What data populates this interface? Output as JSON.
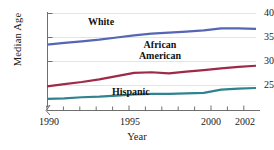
{
  "chart_data": {
    "type": "line",
    "title": "",
    "xlabel": "Year",
    "ylabel": "Median Age",
    "xlim": [
      1990,
      2002
    ],
    "ylim": [
      23.5,
      41
    ],
    "grid": true,
    "legend_position": "inline-annotations",
    "x": [
      1990,
      1991,
      1992,
      1993,
      1994,
      1995,
      1996,
      1997,
      1998,
      1999,
      2000,
      2001,
      2002
    ],
    "xticks": [
      1990,
      1991,
      1992,
      1993,
      1994,
      1995,
      1996,
      1997,
      1998,
      1999,
      2000,
      2001,
      2002
    ],
    "xticklabels": [
      "1990",
      "",
      "",
      "",
      "",
      "1995",
      "",
      "",
      "",
      "",
      "2000",
      "",
      "2002"
    ],
    "yticks": [
      25,
      30,
      35,
      40
    ],
    "yticklabels": [
      "25",
      "30",
      "35",
      "40"
    ],
    "series": [
      {
        "name": "White",
        "color": "#5566b4",
        "values": [
          35.0,
          35.3,
          35.6,
          35.9,
          36.3,
          36.7,
          37.0,
          37.2,
          37.4,
          37.6,
          38.0,
          38.0,
          37.9
        ]
      },
      {
        "name": "African American",
        "color": "#9e2a48",
        "values": [
          27.3,
          27.7,
          28.1,
          28.6,
          29.2,
          29.8,
          29.9,
          29.7,
          30.0,
          30.3,
          30.6,
          30.9,
          31.1
        ]
      },
      {
        "name": "Hispanic",
        "color": "#2f8290",
        "values": [
          25.0,
          25.1,
          25.3,
          25.4,
          25.6,
          25.8,
          25.9,
          25.9,
          26.0,
          26.1,
          26.7,
          26.9,
          27.0
        ]
      }
    ],
    "annotations": [
      {
        "text": "White",
        "series": "White"
      },
      {
        "text": "African\nAmerican",
        "line1": "African",
        "line2": "American",
        "series": "African American"
      },
      {
        "text": "Hispanic",
        "series": "Hispanic"
      }
    ]
  },
  "axes": {
    "y_title": "Median Age",
    "x_title": "Year",
    "y_ticks": [
      "25",
      "30",
      "35",
      "40"
    ],
    "x_ticks": [
      "1990",
      "1995",
      "2000",
      "2002"
    ]
  },
  "annotations": {
    "white": "White",
    "african": "African",
    "american": "American",
    "hispanic": "Hispanic"
  },
  "colors": {
    "white_line": "#5566b4",
    "african_american_line": "#9e2a48",
    "hispanic_line": "#2f8290",
    "axis": "#6f6f6f",
    "grid": "#e3e3e8"
  }
}
